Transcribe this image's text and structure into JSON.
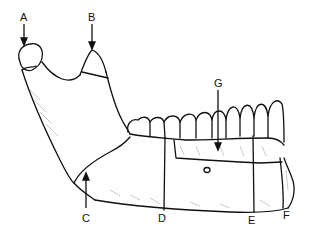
{
  "diagram": {
    "labels": [
      {
        "id": "A",
        "text": "A",
        "x": 22,
        "y": 12
      },
      {
        "id": "B",
        "text": "B",
        "x": 89,
        "y": 12
      },
      {
        "id": "C",
        "text": "C",
        "x": 82,
        "y": 213
      },
      {
        "id": "D",
        "text": "D",
        "x": 158,
        "y": 213
      },
      {
        "id": "E",
        "text": "E",
        "x": 248,
        "y": 215
      },
      {
        "id": "F",
        "text": "F",
        "x": 283,
        "y": 210
      },
      {
        "id": "G",
        "text": "G",
        "x": 215,
        "y": 78
      }
    ],
    "colors": {
      "line": "#111111",
      "background": "#ffffff"
    }
  }
}
